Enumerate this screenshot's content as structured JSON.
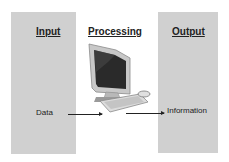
{
  "diagram": {
    "type": "input-processing-output",
    "columns": [
      {
        "heading": "Input",
        "label": "Data"
      },
      {
        "heading": "Processing",
        "icon": "computer-icon"
      },
      {
        "heading": "Output",
        "label": "Information"
      }
    ],
    "colors": {
      "panel": "#d0d0d0",
      "text": "#222222",
      "background": "#ffffff"
    }
  }
}
